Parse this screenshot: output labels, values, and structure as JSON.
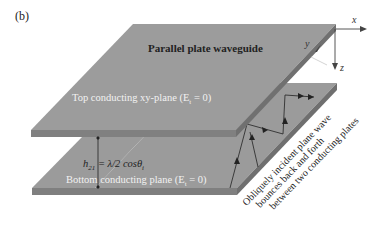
{
  "figure": {
    "panel_label": "(b)",
    "title": "Parallel plate waveguide",
    "top_plate_label": "Top conducting xy-plane (E",
    "top_plate_sub": "t",
    "top_plate_suffix": " = 0)",
    "bottom_plate_label": "Bottom conducting plane (E",
    "bottom_plate_sub": "t",
    "bottom_plate_suffix": " = 0)",
    "separation_h": "h",
    "separation_sub": "21",
    "separation_eq": " = λ/2 cosθ",
    "separation_eq_sub": "i",
    "wave_annotation": [
      "Obliquely incident plane wave",
      "bounces back and forth",
      "between two conducting plates"
    ],
    "axes": {
      "x": "x",
      "y": "y",
      "z": "z"
    },
    "colors": {
      "plate_face": "#9a9a9a",
      "plate_edge": "#7d7d7d",
      "text_dark": "#222222",
      "text_light": "#f2f2f2"
    }
  }
}
